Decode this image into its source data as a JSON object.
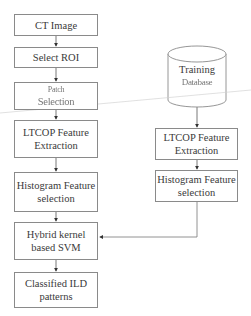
{
  "diagram": {
    "type": "flowchart",
    "left_column": [
      {
        "id": "ct-image",
        "label": "CT Image"
      },
      {
        "id": "select-roi",
        "label": "Select ROI"
      },
      {
        "id": "patch-selection",
        "label_line1": "Patch",
        "label_line2": "Selection"
      },
      {
        "id": "ltcop-left",
        "label_line1": "LTCOP Feature",
        "label_line2": "Extraction"
      },
      {
        "id": "histogram-left",
        "label_line1": "Histogram Feature",
        "label_line2": "selection"
      },
      {
        "id": "hybrid-svm",
        "label_line1": "Hybrid kernel",
        "label_line2": "based SVM"
      },
      {
        "id": "classified",
        "label_line1": "Classified ILD",
        "label_line2": "patterns"
      }
    ],
    "right_column": {
      "database": {
        "label_line1": "Training",
        "label_line2": "Database"
      },
      "ltcop": {
        "label_line1": "LTCOP Feature",
        "label_line2": "Extraction"
      },
      "histogram": {
        "label_line1": "Histogram Feature",
        "label_line2": "selection"
      }
    },
    "edges": [
      [
        "CT Image",
        "Select ROI"
      ],
      [
        "Select ROI",
        "Patch Selection"
      ],
      [
        "Patch Selection",
        "LTCOP Feature Extraction"
      ],
      [
        "LTCOP Feature Extraction",
        "Histogram Feature selection"
      ],
      [
        "Histogram Feature selection",
        "Hybrid kernel based SVM"
      ],
      [
        "Hybrid kernel based SVM",
        "Classified ILD patterns"
      ],
      [
        "Training Database",
        "LTCOP Feature Extraction (right)"
      ],
      [
        "LTCOP Feature Extraction (right)",
        "Histogram Feature selection (right)"
      ],
      [
        "Histogram Feature selection (right)",
        "Hybrid kernel based SVM"
      ]
    ],
    "colors": {
      "stroke": "#8a8a8a",
      "text": "#3a3a3a",
      "background": "#ffffff"
    }
  }
}
